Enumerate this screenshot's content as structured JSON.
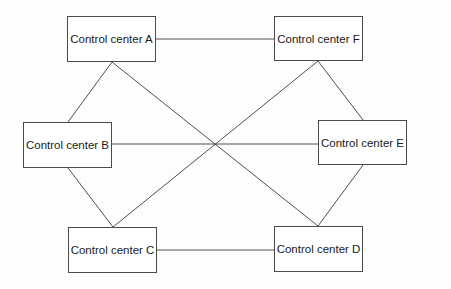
{
  "diagram": {
    "type": "network-topology",
    "nodes": [
      {
        "id": "A",
        "label": "Control center A",
        "x": 67,
        "y": 16,
        "w": 89,
        "h": 46
      },
      {
        "id": "F",
        "label": "Control center F",
        "x": 274,
        "y": 16,
        "w": 89,
        "h": 45
      },
      {
        "id": "B",
        "label": "Control center B",
        "x": 23,
        "y": 122,
        "w": 89,
        "h": 46
      },
      {
        "id": "E",
        "label": "Control center E",
        "x": 318,
        "y": 120,
        "w": 89,
        "h": 45
      },
      {
        "id": "C",
        "label": "Control center C",
        "x": 68,
        "y": 227,
        "w": 89,
        "h": 46
      },
      {
        "id": "D",
        "label": "Control center D",
        "x": 274,
        "y": 226,
        "w": 89,
        "h": 46
      }
    ],
    "edges": [
      {
        "from": "A",
        "to": "F"
      },
      {
        "from": "A",
        "to": "B"
      },
      {
        "from": "A",
        "to": "D"
      },
      {
        "from": "F",
        "to": "E"
      },
      {
        "from": "F",
        "to": "C"
      },
      {
        "from": "B",
        "to": "E"
      },
      {
        "from": "B",
        "to": "C"
      },
      {
        "from": "E",
        "to": "D"
      },
      {
        "from": "C",
        "to": "D"
      }
    ],
    "line_color": "#3c3c3c",
    "border_color": "#4a4a4a"
  }
}
